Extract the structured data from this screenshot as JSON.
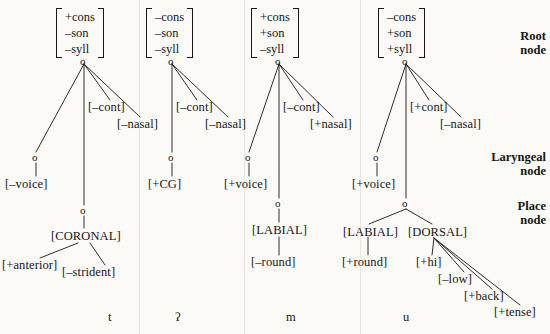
{
  "diagram": {
    "columns": [
      {
        "segment": "t",
        "root_matrix": [
          "+cons",
          "–son",
          "–syll"
        ],
        "root_node": "o",
        "root_features": [
          "[–cont]",
          "[–nasal]"
        ],
        "laryngeal_node": "o",
        "laryngeal_features": [
          "[–voice]"
        ],
        "place_node": "o",
        "place_labels": [
          "[CORONAL]"
        ],
        "place_features": [
          "[+anterior]",
          "[–strident]"
        ]
      },
      {
        "segment": "ʔ",
        "root_matrix": [
          "–cons",
          "–son",
          "–syll"
        ],
        "root_node": "o",
        "root_features": [
          "[–cont]",
          "[–nasal]"
        ],
        "laryngeal_node": "o",
        "laryngeal_features": [
          "[+CG]"
        ],
        "place_node": null,
        "place_labels": [],
        "place_features": []
      },
      {
        "segment": "m",
        "root_matrix": [
          "+cons",
          "+son",
          "–syll"
        ],
        "root_node": "o",
        "root_features": [
          "[–cont]",
          "[+nasal]"
        ],
        "laryngeal_node": "o",
        "laryngeal_features": [
          "[+voice]"
        ],
        "place_node": "o",
        "place_labels": [
          "[LABIAL]"
        ],
        "place_features": [
          "[–round]"
        ]
      },
      {
        "segment": "u",
        "root_matrix": [
          "–cons",
          "+son",
          "+syll"
        ],
        "root_node": "o",
        "root_features": [
          "[+cont]",
          "[–nasal]"
        ],
        "laryngeal_node": "o",
        "laryngeal_features": [
          "[+voice]"
        ],
        "place_node": "o",
        "place_labels": [
          "[LABIAL]",
          "[DORSAL]"
        ],
        "place_features": [
          "[+round]",
          "[+hi]",
          "[–low]",
          "[+back]",
          "[+tense]"
        ]
      }
    ],
    "side_labels": [
      {
        "line1": "Root",
        "line2": "node"
      },
      {
        "line1": "Laryngeal",
        "line2": "node"
      },
      {
        "line1": "Place",
        "line2": "node"
      }
    ],
    "colors": {
      "background": "#fbfaf7",
      "ink": "#161616",
      "separator": "#e9e6df"
    }
  }
}
